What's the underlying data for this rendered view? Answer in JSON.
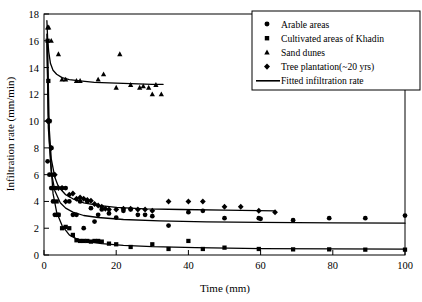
{
  "chart_data": {
    "type": "scatter",
    "title": "",
    "subtitle": "",
    "xlabel": "Time (mm)",
    "ylabel": "Infiltration rate (mm/min)",
    "xlim": [
      0,
      100
    ],
    "ylim": [
      0,
      18
    ],
    "xticks": [
      0,
      20,
      40,
      60,
      80,
      100
    ],
    "yticks": [
      0,
      2,
      4,
      6,
      8,
      10,
      12,
      14,
      16,
      18
    ],
    "grid": false,
    "legend_position": "top-right",
    "legend_boxed": true,
    "marker_color": "#000000",
    "line_color": "#000000",
    "frame_color": "#000000",
    "series": [
      {
        "name": "Arable areas",
        "marker": "circle",
        "x": [
          1,
          1.5,
          2,
          2.5,
          3,
          3.5,
          4,
          5,
          6,
          7,
          8,
          9,
          10,
          11,
          12,
          13,
          14,
          15,
          16,
          18,
          20,
          22,
          24,
          26,
          28,
          30,
          34.5,
          40,
          44,
          50,
          59.5,
          60,
          69,
          79,
          89,
          100
        ],
        "y": [
          7,
          6,
          5,
          4,
          3,
          3,
          3,
          5,
          5,
          4,
          3,
          3,
          4,
          2,
          4,
          3.5,
          2.5,
          3,
          3.4,
          3.1,
          2.8,
          3.3,
          3.4,
          3,
          3,
          2.9,
          2.2,
          3.2,
          3.3,
          2.75,
          2.75,
          2.7,
          2.6,
          2.75,
          2.75,
          2.95
        ]
      },
      {
        "name": "Cultivated areas of Khadin",
        "marker": "square",
        "x": [
          1,
          1.2,
          1.5,
          2,
          2.5,
          3,
          3.5,
          4,
          5,
          6,
          7,
          8,
          9,
          10,
          11,
          12,
          13,
          14,
          15,
          16,
          18,
          20,
          24,
          30,
          34.5,
          40,
          44,
          50,
          59.5,
          69,
          79,
          89,
          100
        ],
        "y": [
          16,
          13,
          10,
          8,
          6,
          5,
          4,
          3,
          2,
          2.1,
          2,
          1.5,
          1.1,
          1.05,
          1.05,
          1.05,
          1,
          1.05,
          1.05,
          1,
          0.85,
          0.8,
          0.6,
          0.8,
          0.45,
          1.05,
          0.45,
          0.55,
          0.45,
          0.42,
          0.42,
          0.4,
          0.4
        ]
      },
      {
        "name": "Sand dunes",
        "marker": "triangle",
        "x": [
          1,
          1.3,
          2,
          4,
          5,
          6,
          9,
          10,
          15,
          16.5,
          20,
          21,
          24,
          26.5,
          27.5,
          29,
          30,
          31,
          32.5
        ],
        "y": [
          17,
          17,
          16,
          15,
          13.1,
          13.1,
          13,
          13,
          13.1,
          13.5,
          12.5,
          15,
          12.7,
          12.5,
          12.6,
          12.5,
          12,
          12.7,
          12
        ]
      },
      {
        "name": "Tree plantation(~20 yrs)",
        "marker": "diamond",
        "x": [
          1,
          1.5,
          2,
          3,
          4,
          5,
          6,
          7,
          8,
          9,
          10,
          11,
          12,
          13,
          14,
          15,
          16,
          17,
          18,
          20,
          22,
          24,
          26,
          28,
          30,
          34.5,
          40,
          44,
          50,
          54.5,
          59.5,
          64
        ],
        "y": [
          10,
          10,
          8,
          6,
          5,
          5,
          4,
          4.5,
          4.6,
          4.2,
          4.3,
          4.2,
          4.1,
          4.05,
          3.8,
          3.7,
          3.6,
          3.45,
          3.4,
          3.4,
          3.45,
          3.45,
          3.4,
          3.4,
          3.3,
          4,
          4,
          4,
          3.6,
          3.6,
          3.3,
          3.2
        ]
      }
    ],
    "fits": [
      {
        "name": "Sand dunes fit",
        "formula_points_x": [
          0.8,
          1,
          1.3,
          1.8,
          2.5,
          3.5,
          5,
          7,
          10,
          14,
          18,
          24,
          30,
          33
        ],
        "formula_points_y": [
          17.5,
          16.2,
          15.2,
          14.3,
          13.8,
          13.5,
          13.25,
          13.1,
          13.0,
          12.9,
          12.85,
          12.8,
          12.75,
          12.75
        ]
      },
      {
        "name": "Tree plantation fit",
        "formula_points_x": [
          0.8,
          1.2,
          2,
          3,
          4,
          6,
          8,
          11,
          15,
          20,
          28,
          38,
          50,
          64
        ],
        "formula_points_y": [
          16.5,
          10.5,
          7.2,
          5.8,
          5.1,
          4.5,
          4.2,
          3.9,
          3.7,
          3.55,
          3.45,
          3.4,
          3.35,
          3.3
        ]
      },
      {
        "name": "Arable areas fit",
        "formula_points_x": [
          0.8,
          1.2,
          2,
          3,
          4.5,
          6,
          8,
          11,
          15,
          22,
          32,
          45,
          60,
          80,
          100
        ],
        "formula_points_y": [
          16,
          9.5,
          6.2,
          4.8,
          3.9,
          3.5,
          3.2,
          2.95,
          2.8,
          2.65,
          2.55,
          2.48,
          2.43,
          2.4,
          2.38
        ]
      },
      {
        "name": "Khadin fit",
        "formula_points_x": [
          1,
          1.5,
          2.5,
          3.5,
          5,
          7,
          9,
          12,
          16,
          22,
          30,
          42,
          60,
          80,
          100
        ],
        "formula_points_y": [
          15.8,
          8.5,
          4.6,
          3.2,
          2.2,
          1.5,
          1.2,
          1.0,
          0.85,
          0.72,
          0.62,
          0.55,
          0.48,
          0.45,
          0.44
        ]
      }
    ]
  },
  "axes": {
    "ylabel": "Infiltration rate (mm/min)",
    "xlabel": "Time (mm)"
  },
  "legend": {
    "items": [
      {
        "label": "Arable areas",
        "marker": "circle"
      },
      {
        "label": "Cultivated areas of Khadin",
        "marker": "square"
      },
      {
        "label": "Sand dunes",
        "marker": "triangle"
      },
      {
        "label": "Tree plantation(~20 yrs)",
        "marker": "diamond"
      },
      {
        "label": "Fitted infiltration rate",
        "marker": "line"
      }
    ]
  }
}
